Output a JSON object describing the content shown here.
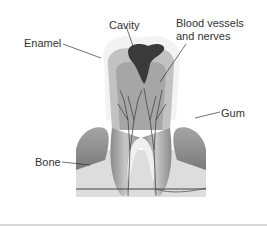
{
  "diagram": {
    "labels": {
      "cavity": "Cavity",
      "blood_vessels_line1": "Blood vessels",
      "blood_vessels_line2": "and nerves",
      "enamel": "Enamel",
      "gum": "Gum",
      "bone": "Bone"
    },
    "colors": {
      "enamel": "#f1f1f1",
      "dentin": "#bdbdbd",
      "pulp": "#9a9a9a",
      "cavity": "#3a3a3a",
      "gum": "#8f8f8f",
      "bone": "#dcdcdc",
      "lines": "#333333"
    }
  }
}
